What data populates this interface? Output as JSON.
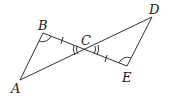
{
  "points": {
    "A": {
      "label": "A",
      "x": 20,
      "y": 80,
      "lx": 11,
      "ly": 93
    },
    "B": {
      "label": "B",
      "x": 43,
      "y": 33,
      "lx": 38,
      "ly": 30
    },
    "C": {
      "label": "C",
      "x": 86,
      "y": 50,
      "lx": 81,
      "ly": 45
    },
    "D": {
      "label": "D",
      "x": 152,
      "y": 17,
      "lx": 149,
      "ly": 14
    },
    "E": {
      "label": "E",
      "x": 127,
      "y": 66,
      "lx": 122,
      "ly": 82
    }
  },
  "segments": [
    [
      "A",
      "B"
    ],
    [
      "A",
      "D"
    ],
    [
      "B",
      "E"
    ],
    [
      "D",
      "E"
    ]
  ],
  "colors": {
    "line": "#333333",
    "text": "#222222"
  }
}
